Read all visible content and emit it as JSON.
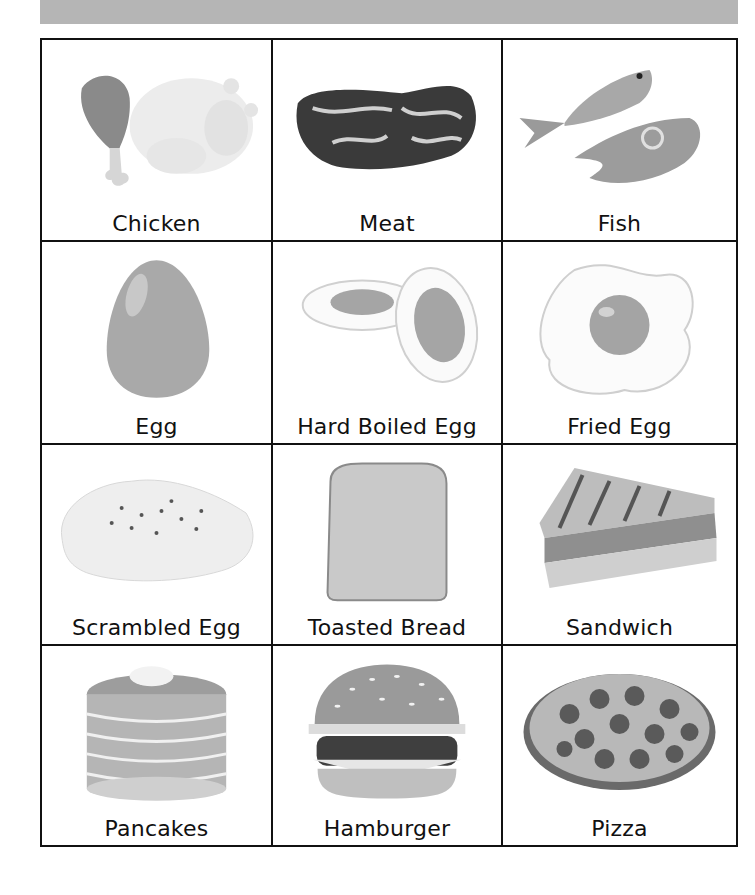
{
  "header": {
    "bar_color": "#b5b5b5"
  },
  "colors": {
    "border": "#111111",
    "label": "#111111"
  },
  "cards": [
    {
      "label": "Chicken",
      "icon": "chicken-icon"
    },
    {
      "label": "Meat",
      "icon": "steak-icon"
    },
    {
      "label": "Fish",
      "icon": "fish-icon"
    },
    {
      "label": "Egg",
      "icon": "egg-icon"
    },
    {
      "label": "Hard Boiled Egg",
      "icon": "hard-boiled-egg-icon"
    },
    {
      "label": "Fried Egg",
      "icon": "fried-egg-icon"
    },
    {
      "label": "Scrambled Egg",
      "icon": "scrambled-egg-icon"
    },
    {
      "label": "Toasted Bread",
      "icon": "toast-icon"
    },
    {
      "label": "Sandwich",
      "icon": "sandwich-icon"
    },
    {
      "label": "Pancakes",
      "icon": "pancakes-icon"
    },
    {
      "label": "Hamburger",
      "icon": "hamburger-icon"
    },
    {
      "label": "Pizza",
      "icon": "pizza-icon"
    }
  ]
}
